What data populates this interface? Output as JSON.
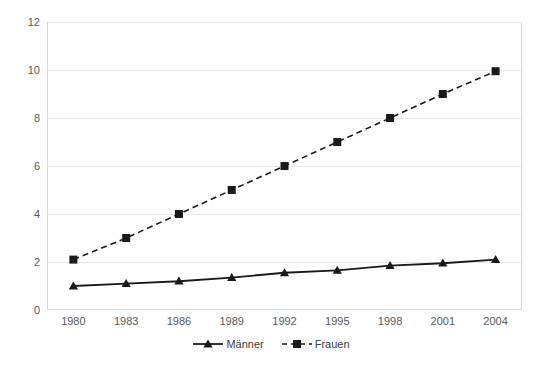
{
  "chart_data": {
    "type": "line",
    "title": "",
    "subtitle": "",
    "xlabel": "",
    "ylabel": "",
    "categories": [
      "1980",
      "1983",
      "1986",
      "1989",
      "1992",
      "1995",
      "1998",
      "2001",
      "2004"
    ],
    "series": [
      {
        "name": "Männer",
        "marker": "triangle",
        "line_style": "solid",
        "color": "#1a1a1a",
        "values": [
          1.0,
          1.1,
          1.2,
          1.35,
          1.55,
          1.65,
          1.85,
          1.95,
          2.1
        ]
      },
      {
        "name": "Frauen",
        "marker": "square",
        "line_style": "dashed",
        "color": "#1a1a1a",
        "values": [
          2.1,
          3.0,
          4.0,
          5.0,
          6.0,
          7.0,
          8.0,
          9.0,
          9.95
        ]
      }
    ],
    "ylim": [
      0,
      12
    ],
    "yticks": [
      0,
      2,
      4,
      6,
      8,
      10,
      12
    ],
    "ytick_labels": [
      "0",
      "2",
      "4",
      "6",
      "8",
      "10",
      "12"
    ],
    "grid": true,
    "grid_axis": "y",
    "legend_position": "bottom",
    "plot_border_color": "#d9d9d9",
    "grid_color": "#e8e8e8",
    "tick_label_color": "#595959",
    "background_color": "#ffffff"
  },
  "legend": {
    "items": [
      {
        "label": "Männer"
      },
      {
        "label": "Frauen"
      }
    ]
  }
}
